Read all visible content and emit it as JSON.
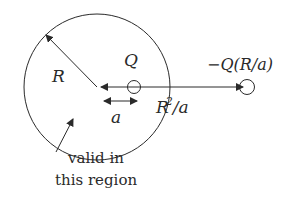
{
  "diagram": {
    "labels": {
      "radius": "R",
      "charge": "Q",
      "image_charge": "−Q(R/a)",
      "distance_a": "a",
      "image_distance_R": "R",
      "image_distance_sup": "2",
      "image_distance_rest": "/a",
      "valid_line1": "valid in",
      "valid_line2": "this region"
    },
    "colors": {
      "stroke": "#2a2a2a",
      "background": "#ffffff"
    }
  }
}
